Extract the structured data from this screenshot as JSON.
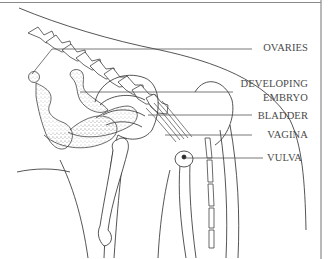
{
  "diagram": {
    "type": "anatomical-illustration",
    "colors": {
      "ink": "#2a2a2a",
      "label_text": "#4a4a4a",
      "leader_line": "#555555",
      "border": "#8a8a8a",
      "stipple": "#777777"
    },
    "labels": [
      {
        "id": "ovaries",
        "text": "OVARIES"
      },
      {
        "id": "developing",
        "text": "DEVELOPING"
      },
      {
        "id": "embryo",
        "text": "EMBRYO"
      },
      {
        "id": "bladder",
        "text": "BLADDER"
      },
      {
        "id": "vagina",
        "text": "VAGINA"
      },
      {
        "id": "vulva",
        "text": "VULVA"
      }
    ]
  }
}
